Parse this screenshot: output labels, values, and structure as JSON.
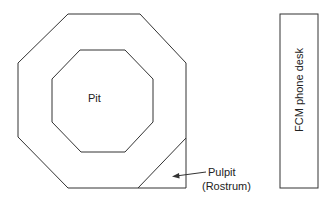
{
  "diagram": {
    "labels": {
      "pit": "Pit",
      "pulpit": "Pulpit",
      "rostrum": "(Rostrum)",
      "phone_desk": "FCM phone desk"
    },
    "colors": {
      "stroke": "#333333",
      "text": "#222222",
      "background": "#ffffff"
    }
  }
}
